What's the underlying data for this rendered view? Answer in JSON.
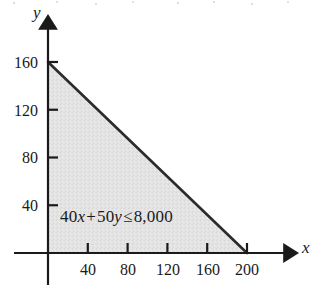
{
  "figure": {
    "background_color": "#ffffff",
    "ink_color": "#1a1a1a",
    "region_fill_color": "#e2e2e2",
    "boundary_color": "#2b2b2b"
  },
  "chart_data": {
    "type": "area",
    "title": "",
    "subtitle": "",
    "xlabel": "x",
    "ylabel": "y",
    "xlim": [
      0,
      230
    ],
    "ylim": [
      0,
      185
    ],
    "xticks": [
      40,
      80,
      120,
      160,
      200
    ],
    "yticks": [
      40,
      80,
      120,
      160
    ],
    "xtick_labels": [
      "40",
      "80",
      "120",
      "160",
      "200"
    ],
    "ytick_labels": [
      "40",
      "80",
      "120",
      "160"
    ],
    "grid": false,
    "legend": false,
    "annotations": [
      {
        "text": "40x + 50y ≤ 8,000",
        "x": 55,
        "y": 28,
        "parts": {
          "coef_x": "40",
          "var_x": "x",
          "plus": "+",
          "coef_y": "50",
          "var_y": "y",
          "relation": "≤",
          "constant": "8,000"
        }
      }
    ],
    "series": [
      {
        "name": "40x + 50y = 8,000",
        "type": "line",
        "x": [
          0,
          200
        ],
        "y": [
          160,
          0
        ],
        "intercepts": {
          "x_intercept": 200,
          "y_intercept": 160
        },
        "style": "solid",
        "color": "#2b2b2b"
      },
      {
        "name": "Feasible region: 40x + 50y ≤ 8,000, x ≥ 0, y ≥ 0",
        "type": "shaded-region",
        "vertices": [
          [
            0,
            0
          ],
          [
            0,
            160
          ],
          [
            200,
            0
          ]
        ],
        "fill": "#e2e2e2"
      }
    ]
  },
  "axes": {
    "y_axis_name": "y",
    "x_axis_name": "x",
    "y_ticks": [
      {
        "label": "160"
      },
      {
        "label": "120"
      },
      {
        "label": "80"
      },
      {
        "label": "40"
      }
    ],
    "x_ticks": [
      {
        "label": "40"
      },
      {
        "label": "80"
      },
      {
        "label": "120"
      },
      {
        "label": "160"
      },
      {
        "label": "200"
      }
    ]
  }
}
